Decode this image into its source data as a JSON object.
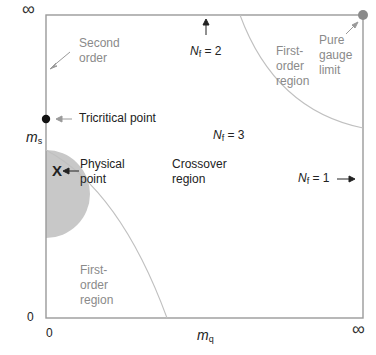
{
  "axes": {
    "x_label": "m",
    "x_sub": "q",
    "y_label": "m",
    "y_sub": "s",
    "x_zero": "0",
    "y_zero": "0",
    "x_infinity": "∞",
    "y_infinity": "∞"
  },
  "labels": {
    "second_order": [
      "Second",
      "order"
    ],
    "tricritical": "Tricritical point",
    "physical_point": [
      "Physical",
      "point"
    ],
    "physical_marker": "X",
    "crossover": [
      "Crossover",
      "region"
    ],
    "first_order_upper": [
      "First-",
      "order",
      "region"
    ],
    "first_order_lower": [
      "First-",
      "order",
      "region"
    ],
    "pure_gauge": [
      "Pure",
      "gauge",
      "limit"
    ],
    "nf2": {
      "n": "N",
      "sub": "f",
      "eq": " = 2"
    },
    "nf3": {
      "n": "N",
      "sub": "f",
      "eq": " = 3"
    },
    "nf1": {
      "n": "N",
      "sub": "f",
      "eq": " = 1"
    }
  },
  "colors": {
    "axis": "#9a9a9a",
    "shaded": "#c8c8c8",
    "curve": "#c0c0c0",
    "gray_text": "#8a8a8a",
    "dark_text": "#222222"
  }
}
